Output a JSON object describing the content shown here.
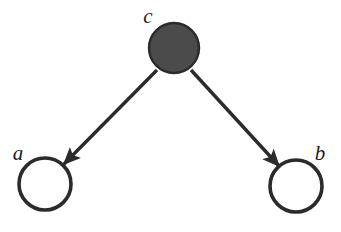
{
  "diagram": {
    "type": "directed-graph",
    "background_color": "#ffffff",
    "stroke_color": "#2b2b2b",
    "nodes": [
      {
        "id": "a",
        "label": "a",
        "shape": "circle",
        "filled": false,
        "fill_color": "#ffffff",
        "stroke_color": "#2b2b2b",
        "cx": 45,
        "cy": 184,
        "r": 26,
        "label_x": 18,
        "label_y": 155
      },
      {
        "id": "b",
        "label": "b",
        "shape": "circle",
        "filled": false,
        "fill_color": "#ffffff",
        "stroke_color": "#2b2b2b",
        "cx": 296,
        "cy": 186,
        "r": 26,
        "label_x": 320,
        "label_y": 155
      },
      {
        "id": "c",
        "label": "c",
        "shape": "circle",
        "filled": true,
        "fill_color": "#4b4b4b",
        "stroke_color": "#2b2b2b",
        "cx": 174,
        "cy": 48,
        "r": 25,
        "label_x": 148,
        "label_y": 18
      }
    ],
    "edges": [
      {
        "id": "c-to-a",
        "from": "c",
        "to": "a",
        "directed": true,
        "x1": 157,
        "y1": 70,
        "x2": 64,
        "y2": 164
      },
      {
        "id": "c-to-b",
        "from": "c",
        "to": "b",
        "directed": true,
        "x1": 191,
        "y1": 70,
        "x2": 279,
        "y2": 166
      }
    ]
  }
}
